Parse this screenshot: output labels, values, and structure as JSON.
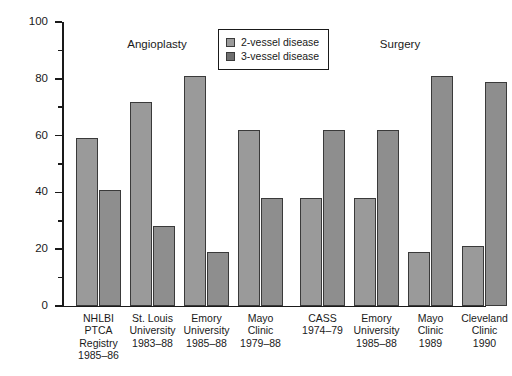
{
  "chart_data": {
    "type": "bar",
    "title": "",
    "xlabel": "",
    "ylabel": "Percent",
    "ylim": [
      0,
      100
    ],
    "grid": false,
    "legend_position": "top-center",
    "y_major_ticks": [
      0,
      20,
      40,
      60,
      80,
      100
    ],
    "y_minor_ticks": [
      10,
      30,
      50,
      70,
      90
    ],
    "y_tick_labels": [
      "0",
      "20",
      "40",
      "60",
      "80",
      "100"
    ],
    "panel_headings": [
      "Angioplasty",
      "Surgery"
    ],
    "series": [
      {
        "name": "2-vessel disease",
        "color": "#9a9a9a",
        "values": [
          59,
          72,
          81,
          62,
          38,
          38,
          19,
          21
        ]
      },
      {
        "name": "3-vessel disease",
        "color": "#8e8e8e",
        "values": [
          41,
          28,
          19,
          38,
          62,
          62,
          81,
          79
        ]
      }
    ],
    "categories": [
      {
        "group": "Angioplasty",
        "lines": [
          "NHLBI",
          "PTCA",
          "Registry",
          "1985–86"
        ]
      },
      {
        "group": "Angioplasty",
        "lines": [
          "St. Louis",
          "University",
          "1983–88"
        ]
      },
      {
        "group": "Angioplasty",
        "lines": [
          "Emory",
          "University",
          "1985–88"
        ]
      },
      {
        "group": "Angioplasty",
        "lines": [
          "Mayo",
          "Clinic",
          "1979–88"
        ]
      },
      {
        "group": "Surgery",
        "lines": [
          "CASS",
          "1974–79"
        ]
      },
      {
        "group": "Surgery",
        "lines": [
          "Emory",
          "University",
          "1985–88"
        ]
      },
      {
        "group": "Surgery",
        "lines": [
          "Mayo",
          "Clinic",
          "1989"
        ]
      },
      {
        "group": "Surgery",
        "lines": [
          "Cleveland",
          "Clinic",
          "1990"
        ]
      }
    ]
  },
  "legend": {
    "entries": [
      {
        "label": "2-vessel disease",
        "swatch": "legend-swatch-2-vessel"
      },
      {
        "label": "3-vessel disease",
        "swatch": "legend-swatch-3-vessel"
      }
    ]
  },
  "axis": {
    "y_title": "Percent"
  }
}
